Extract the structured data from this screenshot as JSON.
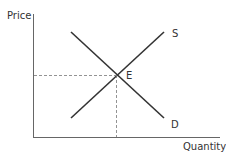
{
  "diagram": {
    "axes": {
      "y_label": "Price",
      "x_label": "Quantity"
    },
    "curves": [
      {
        "name": "Supply",
        "label": "S"
      },
      {
        "name": "Demand",
        "label": "D"
      }
    ],
    "equilibrium": {
      "label": "E"
    }
  }
}
